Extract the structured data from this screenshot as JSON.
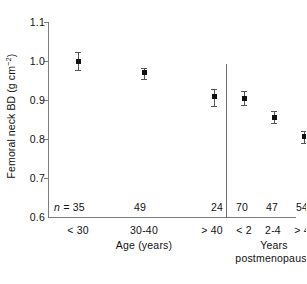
{
  "chart_data": {
    "type": "scatter",
    "title": "",
    "xlabel": "Age (years)",
    "xlabel2": "Years postmenopause",
    "ylabel_parts": {
      "main": "Femoral neck BD (g cm",
      "exponent": "−2",
      "close": ")"
    },
    "ylabel": "Femoral neck BD (g cm−2)",
    "ylim": [
      0.6,
      1.1
    ],
    "yticks": [
      "1.1",
      "1.0",
      "0.9",
      "0.8",
      "0.7",
      "0.6"
    ],
    "ytick_values": [
      1.1,
      1.0,
      0.9,
      0.8,
      0.7,
      0.6
    ],
    "grid": false,
    "legend": "none",
    "n_prefix": "n =",
    "categories": [
      "< 30",
      "30-40",
      "> 40",
      "< 2",
      "2-4",
      "> 4"
    ],
    "values": [
      1.0,
      0.97,
      0.91,
      0.905,
      0.856,
      0.806
    ],
    "errors_low": [
      0.978,
      0.955,
      0.885,
      0.888,
      0.84,
      0.791
    ],
    "errors_high": [
      1.022,
      0.983,
      0.928,
      0.923,
      0.872,
      0.821
    ],
    "n": [
      35,
      49,
      24,
      70,
      47,
      54
    ],
    "group_split_after_index": 2,
    "groups": [
      {
        "label": "Age (years)",
        "categories": [
          "< 30",
          "30-40",
          "> 40"
        ]
      },
      {
        "label": "Years postmenopause",
        "categories": [
          "< 2",
          "2-4",
          "> 4"
        ]
      }
    ],
    "marker_color": "#111111",
    "error_color": "#555555",
    "axis_color": "#7c7c7c"
  },
  "xtick_labels": {
    "0": "< 30",
    "1": "30-40",
    "2": "> 40",
    "3": "< 2",
    "4": "2-4",
    "5": "> 4"
  },
  "n_labels": {
    "prefix": "n =",
    "0": "35",
    "1": "49",
    "2": "24",
    "3": "70",
    "4": "47",
    "5": "54"
  },
  "axis_titles": {
    "x_left": "Age (years)",
    "x_right_line1": "Years",
    "x_right_line2": "postmenopause"
  },
  "y_axis": {
    "t0": "1.1",
    "t1": "1.0",
    "t2": "0.9",
    "t3": "0.8",
    "t4": "0.7",
    "t5": "0.6"
  },
  "y_label_text": {
    "main": "Femoral neck BD (g cm",
    "exponent": "−2",
    "close": ")"
  }
}
